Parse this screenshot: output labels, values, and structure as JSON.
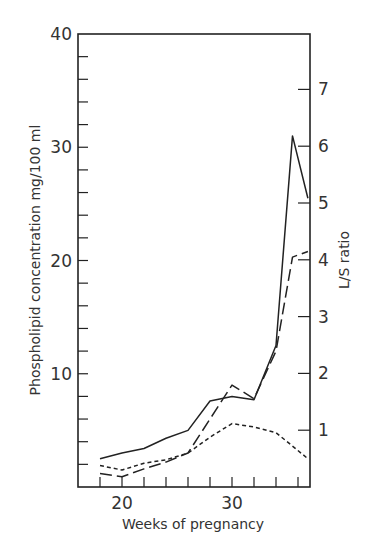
{
  "chart_data": {
    "type": "line",
    "title": "",
    "xlabel": "Weeks of pregnancy",
    "ylabel": "Phospholipid concentration mg/100 ml",
    "y2label": "L/S ratio",
    "xlim": [
      16,
      37
    ],
    "ylim": [
      0,
      40
    ],
    "y2lim": [
      0,
      8
    ],
    "x_ticks_labeled": [
      20,
      30
    ],
    "x_ticks_minor": [
      18,
      20,
      22,
      24,
      26,
      28,
      30,
      32,
      34,
      36
    ],
    "y_ticks_labeled": [
      10,
      20,
      30,
      40
    ],
    "y2_ticks_labeled": [
      1,
      2,
      3,
      4,
      5,
      6,
      7
    ],
    "grid": false,
    "legend": "none",
    "series": [
      {
        "name": "solid line",
        "style": "solid",
        "x": [
          18,
          20,
          22,
          24,
          26,
          28,
          30,
          32,
          34,
          35.5,
          37
        ],
        "values": [
          2.5,
          3.0,
          3.4,
          4.3,
          5.0,
          7.6,
          8.0,
          7.7,
          12.5,
          31.0,
          25.5
        ]
      },
      {
        "name": "long-dashed line",
        "style": "long-dash",
        "x": [
          18,
          20,
          22,
          24,
          26,
          28,
          30,
          32,
          34,
          35.5,
          37
        ],
        "values": [
          1.2,
          0.9,
          1.6,
          2.2,
          3.0,
          6.0,
          9.0,
          7.8,
          12.0,
          20.3,
          20.8
        ]
      },
      {
        "name": "dotted line",
        "style": "short-dash",
        "x": [
          18,
          20,
          22,
          24,
          26,
          28,
          30,
          32,
          34,
          37
        ],
        "values": [
          1.9,
          1.5,
          2.1,
          2.4,
          3.0,
          4.4,
          5.6,
          5.3,
          4.8,
          2.5
        ]
      }
    ]
  },
  "labels": {
    "xlabel": "Weeks of pregnancy",
    "ylabel": "Phospholipid concentration mg/100 ml",
    "y2label": "L/S ratio"
  }
}
